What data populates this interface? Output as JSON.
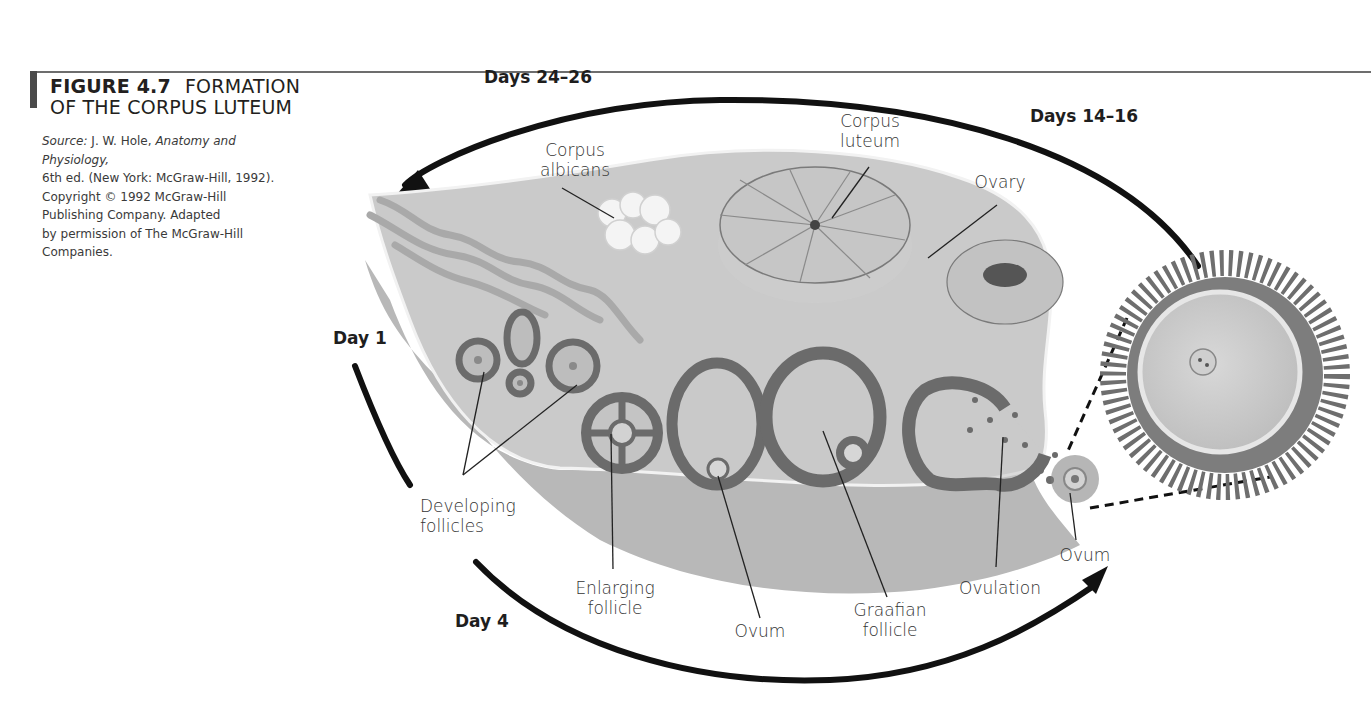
{
  "figure": {
    "number": "FIGURE 4.7",
    "title": "FORMATION OF THE CORPUS LUTEUM",
    "title_line1": "FORMATION",
    "title_line2": "OF THE CORPUS LUTEUM",
    "source": {
      "prefix": "Source:",
      "author": "J. W. Hole,",
      "book": "Anatomy and Physiology,",
      "line2": "6th ed. (New York: McGraw-Hill, 1992).",
      "line3": "Copyright © 1992 McGraw-Hill",
      "line4": "Publishing Company. Adapted",
      "line5": "by permission of The McGraw-Hill",
      "line6": "Companies."
    }
  },
  "cycle_days": {
    "day1": "Day 1",
    "day4": "Day 4",
    "days14_16": "Days 14–16",
    "days24_26": "Days 24–26"
  },
  "labels": {
    "corpus_albicans": [
      "Corpus",
      "albicans"
    ],
    "corpus_luteum": [
      "Corpus",
      "luteum"
    ],
    "ovary": "Ovary",
    "developing_follicles": [
      "Developing",
      "follicles"
    ],
    "enlarging_follicle": [
      "Enlarging",
      "follicle"
    ],
    "ovum_inner": "Ovum",
    "graafian_follicle": [
      "Graafian",
      "follicle"
    ],
    "ovulation": "Ovulation",
    "ovum_released": "Ovum"
  },
  "colors": {
    "ovary_fill": "#c9c9c9",
    "ovary_lower": "#b4b4b4",
    "follicle_ring": "#6b6b6b",
    "arrow": "#111111",
    "text": "#231f20"
  }
}
